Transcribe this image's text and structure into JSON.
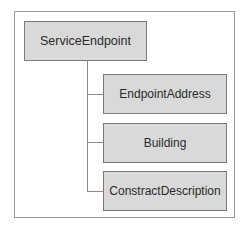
{
  "diagram": {
    "type": "tree",
    "root": {
      "label": "ServiceEndpoint"
    },
    "children": [
      {
        "label": "EndpointAddress"
      },
      {
        "label": "Building"
      },
      {
        "label": "ConstractDescription"
      }
    ],
    "colors": {
      "node_fill": "#d9d9d9",
      "node_border": "#7a7a7a",
      "connector": "#8a8a8a",
      "frame_border": "#9a9a9a",
      "text": "#2a2a2a"
    }
  }
}
